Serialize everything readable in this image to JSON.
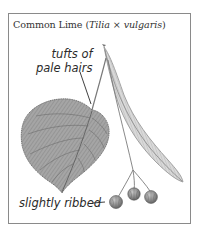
{
  "figure": {
    "title_common": "Common Lime (",
    "title_genus": "Tilia",
    "title_cross": " × ",
    "title_species": "vulgaris",
    "title_close": ")",
    "labels": {
      "tufts_line1": "tufts of",
      "tufts_line2": "pale hairs",
      "ribbed": "slightly ribbed"
    },
    "parts": [
      "leaf-icon",
      "bract-icon",
      "fruit-cluster-icon"
    ],
    "colors": {
      "frame": "#8a8a8a",
      "ink": "#2a2a2a",
      "leaf_fill": "#9a9a9a",
      "leaf_vein": "#6f6f6f",
      "bract_fill": "#cfcfcf",
      "fruit_fill": "#8c8c8c"
    }
  }
}
